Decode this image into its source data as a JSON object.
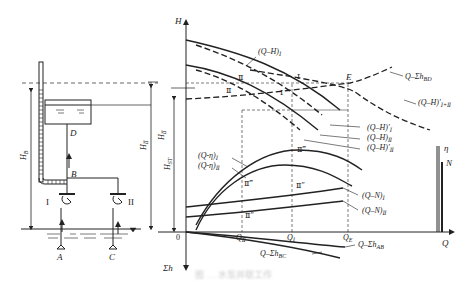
{
  "diagram": {
    "type": "pump-parallel-operation-characteristic",
    "schematic": {
      "nodes": [
        "A",
        "B",
        "C",
        "D"
      ],
      "pumps": [
        {
          "id": "I",
          "node": "A"
        },
        {
          "id": "II",
          "node": "C"
        }
      ],
      "heads": {
        "left": "H_B",
        "right": "H_II"
      }
    },
    "axes": {
      "y_top": "H",
      "y_bottom": "Σh",
      "x": "Q",
      "origin": "0",
      "right_axis_eta": "η",
      "right_axis_N": "N"
    },
    "vertical_markers": [
      "H_II",
      "H_ST"
    ],
    "x_markers": [
      "Q_II",
      "Q_I",
      "Q_E"
    ],
    "point_E": "E",
    "curve_labels": {
      "qh1": "(Q–H)",
      "qh1_sub": "I",
      "sys_bd": "Q–Σh",
      "sys_bd_sub": "BD",
      "qh12": "(Q–H)′",
      "qh12_sub": "I+II",
      "qh1p": "(Q–H)′",
      "qh1p_sub": "I",
      "qh2": "(Q–H)",
      "qh2_sub": "II",
      "qh2p": "(Q–H)′",
      "qh2p_sub": "II",
      "qeta1": "(Q-η)",
      "qeta1_sub": "I",
      "qeta2": "(Q-η)",
      "qeta2_sub": "II",
      "qn1": "(Q–N)",
      "qn1_sub": "I",
      "qn2": "(Q–N)",
      "qn2_sub": "II",
      "sys_ab": "Q–Σh",
      "sys_ab_sub": "AB",
      "sys_bc": "Q–Σh",
      "sys_bc_sub": "BC"
    },
    "roman_marks": [
      "I",
      "II",
      "I",
      "II",
      "I",
      "II‴",
      "II‴",
      "II″",
      "II″"
    ],
    "caption": "图 … 水泵并联工作"
  }
}
